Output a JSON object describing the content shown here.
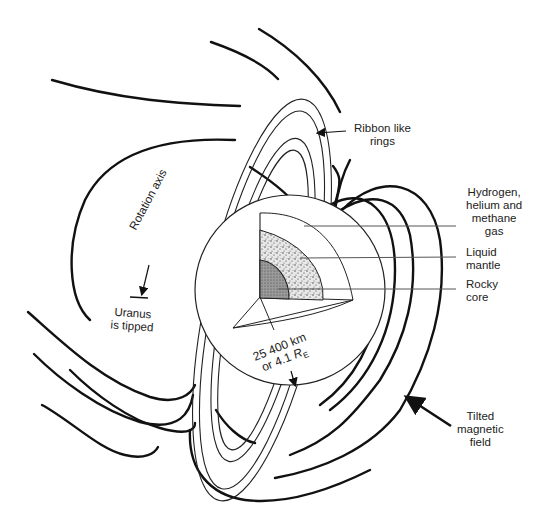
{
  "diagram": {
    "labels": {
      "rings": "Ribbon like\nrings",
      "rings_l1": "Ribbon like",
      "rings_l2": "rings",
      "atmosphere_l1": "Hydrogen,",
      "atmosphere_l2": "helium and",
      "atmosphere_l3": "methane",
      "atmosphere_l4": "gas",
      "mantle_l1": "Liquid",
      "mantle_l2": "mantle",
      "core_l1": "Rocky",
      "core_l2": "core",
      "axis": "Rotation axis",
      "tipped_l1": "Uranus",
      "tipped_l2": "is tipped",
      "radius_l1": "25 400 km",
      "radius_l2_prefix": "or 4.1 ",
      "radius_l2_symbol": "R",
      "radius_l2_sub": "E",
      "magnetic_l1": "Tilted",
      "magnetic_l2": "magnetic",
      "magnetic_l3": "field"
    },
    "colors": {
      "line": "#111111",
      "mantle_fill": "#d9d9d9",
      "core_fill": "#8c8c8c",
      "background": "#ffffff"
    }
  }
}
